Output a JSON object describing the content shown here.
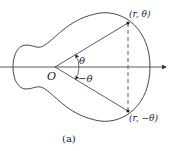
{
  "figure": {
    "caption": "(a)",
    "origin_label": "O",
    "angle_label_pos": "θ",
    "angle_label_neg": "−θ",
    "point_upper_label": "(r, θ)",
    "point_lower_label": "(r, −θ)"
  },
  "colors": {
    "stroke": "#333333",
    "text": "#222222"
  }
}
